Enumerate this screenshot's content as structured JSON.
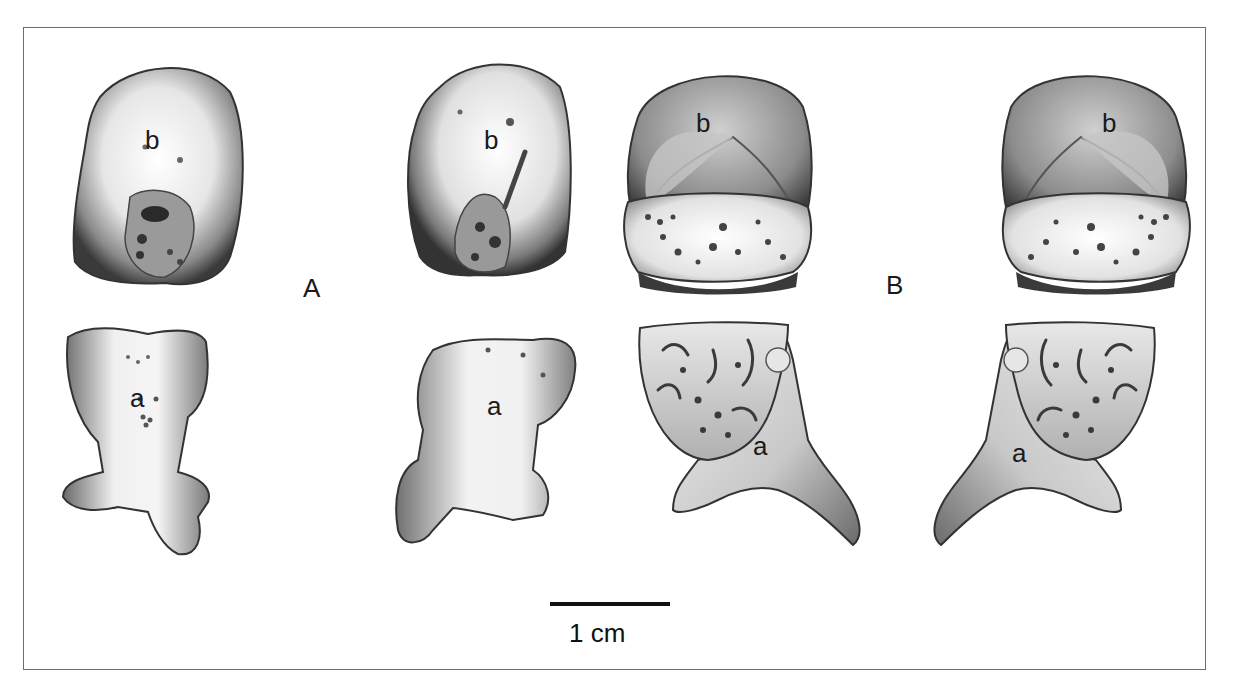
{
  "figure": {
    "groups": [
      {
        "id": "A",
        "label": "A"
      },
      {
        "id": "B",
        "label": "B"
      }
    ],
    "specimens": [
      {
        "group": "A",
        "view": "upper-left",
        "label": "b"
      },
      {
        "group": "A",
        "view": "upper-right",
        "label": "b"
      },
      {
        "group": "A",
        "view": "lower-left",
        "label": "a"
      },
      {
        "group": "A",
        "view": "lower-right",
        "label": "a"
      },
      {
        "group": "B",
        "view": "upper-left",
        "label": "b"
      },
      {
        "group": "B",
        "view": "upper-right",
        "label": "b"
      },
      {
        "group": "B",
        "view": "lower-left",
        "label": "a"
      },
      {
        "group": "B",
        "view": "lower-right",
        "label": "a"
      }
    ],
    "scale_bar": {
      "label": "1 cm"
    },
    "colors": {
      "ink": "#111111",
      "frame": "#6e6e6e",
      "bone_light": "#f2f2f2",
      "bone_mid": "#a8a8a8",
      "bone_dark": "#3a3a3a"
    }
  }
}
